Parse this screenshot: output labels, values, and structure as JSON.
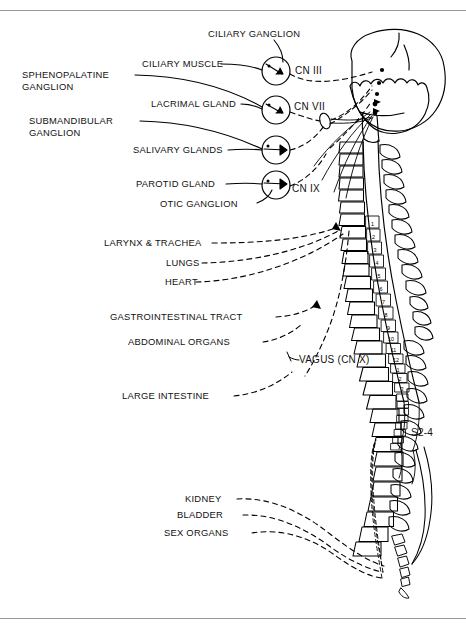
{
  "figure": {
    "domain_title": "Parasympathetic nervous system distribution diagram",
    "rules": {
      "top_label": "top-divider-rule",
      "bottom_label": "bottom-divider-rule"
    },
    "caption": "",
    "colors": {
      "ink": "#000000",
      "rule": "#9a9a9a",
      "background": "#ffffff"
    }
  },
  "labels": {
    "ciliary_ganglion": "CILIARY GANGLION",
    "ciliary_muscle": "CILIARY MUSCLE",
    "sphenopalatine_ganglion": "SPHENOPALATINE GANGLION",
    "lacrimal_gland": "LACRIMAL GLAND",
    "submandibular_ganglion": "SUBMANDIBULAR GANGLION",
    "salivary_glands": "SALIVARY GLANDS",
    "parotid_gland": "PAROTID GLAND",
    "otic_ganglion": "OTIC  GANGLION",
    "larynx_trachea": "LARYNX & TRACHEA",
    "lungs": "LUNGS",
    "heart": "HEART",
    "gastrointestinal_tract": "GASTROINTESTINAL TRACT",
    "abdominal_organs": "ABDOMINAL ORGANS",
    "large_intestine": "LARGE INTESTINE",
    "kidney": "KIDNEY",
    "bladder": "BLADDER",
    "sex_organs": "SEX ORGANS"
  },
  "cranial_nerves": {
    "cn3": "CN III",
    "cn7": "CN VII",
    "cn9": "CN IX",
    "vagus": "VAGUS (CN X)"
  },
  "spinal": {
    "sacral_label": "S2-4",
    "thoracic_numbers": [
      "1",
      "2",
      "3",
      "4",
      "5",
      "6",
      "7",
      "8",
      "9",
      "10",
      "11",
      "12"
    ],
    "lumbar_numbers": [
      "1",
      "2",
      "3"
    ]
  }
}
